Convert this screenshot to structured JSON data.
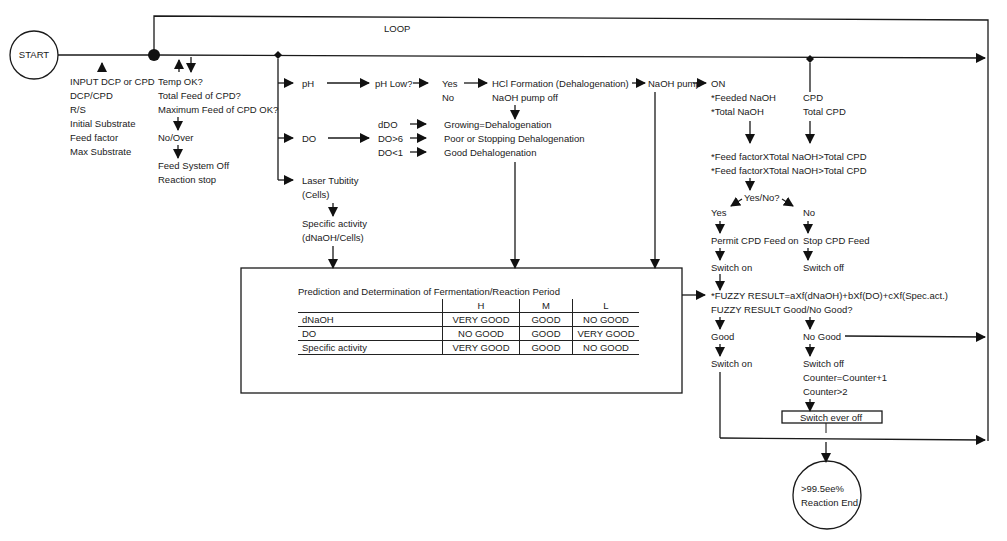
{
  "diagram": {
    "start_label": "START",
    "loop_label": "LOOP",
    "inputs": [
      "INPUT DCP or CPD",
      "DCP/CPD",
      "R/S",
      "Initial Substrate",
      "Feed factor",
      "Max Substrate"
    ],
    "checks": {
      "temp": "Temp OK?",
      "total_feed": "Total Feed of CPD?",
      "max_feed": "Maximum Feed of CPD OK?",
      "no_over": "No/Over",
      "feed_off": "Feed System Off",
      "reaction_stop": "Reaction stop"
    },
    "branches": {
      "ph": "pH",
      "do": "DO",
      "laser": "Laser Tubitity",
      "laser_sub": "(Cells)",
      "spec": "Specific activity",
      "spec_sub": "(dNaOH/Cells)"
    },
    "ph_path": {
      "ph_low": "pH Low?",
      "yes": "Yes",
      "no": "No",
      "hcl": "HCl Formation (Dehalogenation)",
      "pump_off": "NaOH pump off",
      "naoh_pump": "NaOH pump",
      "on": "ON"
    },
    "do_path": {
      "ddo": "dDO",
      "do_gt6": "DO>6",
      "do_lt1": "DO<1",
      "growing": "Growing=Dehalogenation",
      "poor": "Poor or Stopping Dehalogenation",
      "good": "Good Dehalogenation"
    },
    "naoh_path": {
      "feeded": "*Feeded NaOH",
      "total": "*Total NaOH",
      "cpd": "CPD",
      "total_cpd": "Total CPD",
      "cond1": "*Feed factorXTotal NaOH>Total CPD",
      "cond2": "*Feed factorXTotal NaOH>Total CPD",
      "yes_no": "Yes/No?",
      "yes": "Yes",
      "no": "No",
      "permit": "Permit CPD Feed on",
      "stop": "Stop CPD Feed",
      "switch_on": "Switch on",
      "switch_off": "Switch off"
    },
    "fuzzy": {
      "formula": "*FUZZY RESULT=aXf(dNaOH)+bXf(DO)+cXf(Spec.act.)",
      "question": "FUZZY RESULT Good/No Good?",
      "good": "Good",
      "no_good": "No Good",
      "switch_on": "Switch on",
      "switch_off": "Switch off",
      "counter_inc": "Counter=Counter+1",
      "counter_gt": "Counter>2",
      "switch_ever_off": "Switch ever off"
    },
    "end": {
      "line1": ">99.5ee%",
      "line2": "Reaction End"
    },
    "table": {
      "title": "Prediction and Determination of Fermentation/Reaction Period",
      "columns": [
        "H",
        "M",
        "L"
      ],
      "rows": [
        {
          "label": "dNaOH",
          "H": "VERY GOOD",
          "M": "GOOD",
          "L": "NO GOOD"
        },
        {
          "label": "DO",
          "H": "NO GOOD",
          "M": "GOOD",
          "L": "VERY GOOD"
        },
        {
          "label": "Specific activity",
          "H": "VERY GOOD",
          "M": "GOOD",
          "L": "NO GOOD"
        }
      ]
    }
  }
}
